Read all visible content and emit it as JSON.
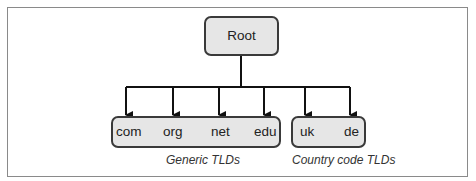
{
  "diagram": {
    "root": {
      "label": "Root"
    },
    "groups": [
      {
        "caption": "Generic TLDs",
        "nodes": [
          "com",
          "org",
          "net",
          "edu"
        ]
      },
      {
        "caption": "Country code TLDs",
        "nodes": [
          "uk",
          "de"
        ]
      }
    ],
    "colors": {
      "box_fill": "#e6e6e6",
      "box_border": "#3a3a3a",
      "line": "#111111",
      "frame": "#8a8a8a"
    }
  }
}
